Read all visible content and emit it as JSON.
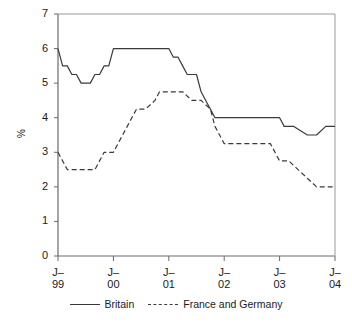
{
  "chart_data": {
    "type": "line",
    "title": "",
    "xlabel": "",
    "ylabel": "%",
    "ylim": [
      0,
      7
    ],
    "yticks": [
      0,
      1,
      2,
      3,
      4,
      5,
      6,
      7
    ],
    "ytick_labels": [
      "0",
      "1",
      "2",
      "3",
      "4",
      "5",
      "6",
      "7"
    ],
    "grid": false,
    "legend_position": "bottom-center",
    "xtick_labels": [
      {
        "month": "J–",
        "year": "99"
      },
      {
        "month": "J–",
        "year": "00"
      },
      {
        "month": "J–",
        "year": "01"
      },
      {
        "month": "J–",
        "year": "02"
      },
      {
        "month": "J–",
        "year": "03"
      },
      {
        "month": "J–",
        "year": "04"
      }
    ],
    "x_start": "J-99",
    "x_end": "J-04",
    "x_range_years": [
      1999.0,
      2004.0
    ],
    "series": [
      {
        "name": "Britain",
        "style": "solid",
        "color": "#3a3a3a",
        "x": [
          1999.0,
          1999.083,
          1999.167,
          1999.25,
          1999.333,
          1999.417,
          1999.5,
          1999.583,
          1999.667,
          1999.75,
          1999.833,
          1999.917,
          2000.0,
          2000.25,
          2000.5,
          2000.75,
          2001.0,
          2001.083,
          2001.167,
          2001.25,
          2001.333,
          2001.417,
          2001.5,
          2001.583,
          2001.667,
          2001.75,
          2001.833,
          2002.0,
          2002.5,
          2003.0,
          2003.083,
          2003.25,
          2003.5,
          2003.667,
          2003.833,
          2004.0
        ],
        "values": [
          6.0,
          5.5,
          5.5,
          5.25,
          5.25,
          5.0,
          5.0,
          5.0,
          5.25,
          5.25,
          5.5,
          5.5,
          6.0,
          6.0,
          6.0,
          6.0,
          6.0,
          5.75,
          5.75,
          5.5,
          5.25,
          5.25,
          5.25,
          4.75,
          4.5,
          4.25,
          4.0,
          4.0,
          4.0,
          4.0,
          3.75,
          3.75,
          3.5,
          3.5,
          3.75,
          3.75
        ]
      },
      {
        "name": "France and Germany",
        "style": "dashed",
        "color": "#3a3a3a",
        "x": [
          1999.0,
          1999.167,
          1999.333,
          1999.5,
          1999.667,
          1999.833,
          2000.0,
          2000.25,
          2000.417,
          2000.583,
          2000.75,
          2000.833,
          2001.0,
          2001.25,
          2001.417,
          2001.583,
          2001.75,
          2001.833,
          2002.0,
          2002.5,
          2002.833,
          2003.0,
          2003.167,
          2003.333,
          2003.5,
          2003.667,
          2004.0
        ],
        "values": [
          3.0,
          2.5,
          2.5,
          2.5,
          2.5,
          3.0,
          3.0,
          3.75,
          4.25,
          4.25,
          4.5,
          4.75,
          4.75,
          4.75,
          4.5,
          4.5,
          4.25,
          3.75,
          3.25,
          3.25,
          3.25,
          2.75,
          2.75,
          2.5,
          2.25,
          2.0,
          2.0
        ]
      }
    ],
    "legend_entries": [
      {
        "label": "Britain",
        "style": "solid"
      },
      {
        "label": "France and Germany",
        "style": "dashed"
      }
    ]
  }
}
